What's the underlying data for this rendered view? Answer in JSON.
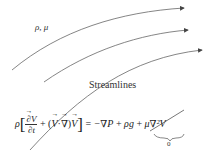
{
  "diagram": {
    "properties_label": "ρ, μ",
    "streamlines_label": "Streamlines",
    "streamline_count": 3,
    "line_color": "#555555",
    "equation": {
      "lhs_coefficient": "ρ",
      "time_derivative_numerator": "∂V",
      "time_derivative_denominator": "∂t",
      "plus1": "+",
      "convective_open": "(",
      "convective_V": "V",
      "dot": "·",
      "nabla": "∇",
      "convective_close": ")",
      "convective_V2": "V",
      "equals": "=",
      "pressure_term": "−∇P",
      "plus2": "+",
      "gravity_term": "ρg",
      "plus3": "+",
      "viscous_term": "μ∇²V",
      "viscous_note": "0"
    }
  }
}
